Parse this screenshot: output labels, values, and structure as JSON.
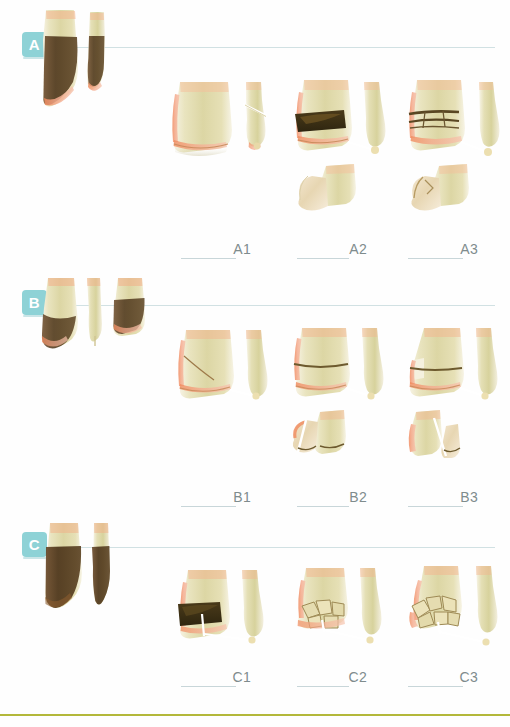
{
  "figure": {
    "title": "",
    "background_color": "#ffffff",
    "badge_color": "#8ed2d6",
    "rule_color": "#cfdfe2",
    "label_color": "#7f8c8d",
    "footer_rule_color": "#b3b83a"
  },
  "groups": [
    {
      "id": "group-a",
      "badge": "A",
      "overview_icon": "distal-tibia-fibula-extraarticular",
      "subtypes": [
        {
          "id": "a1",
          "label": "A1",
          "icon": "simple-extraarticular-fracture"
        },
        {
          "id": "a2",
          "label": "A2",
          "icon": "metaphyseal-wedge-fracture"
        },
        {
          "id": "a3",
          "label": "A3",
          "icon": "metaphyseal-complex-fracture"
        }
      ]
    },
    {
      "id": "group-b",
      "badge": "B",
      "overview_icon": "distal-tibia-fibula-partial-articular",
      "subtypes": [
        {
          "id": "b1",
          "label": "B1",
          "icon": "partial-articular-split-fracture"
        },
        {
          "id": "b2",
          "label": "B2",
          "icon": "partial-articular-split-depression"
        },
        {
          "id": "b3",
          "label": "B3",
          "icon": "partial-articular-multifragmentary-depression"
        }
      ]
    },
    {
      "id": "group-c",
      "badge": "C",
      "overview_icon": "distal-tibia-fibula-complete-articular",
      "subtypes": [
        {
          "id": "c1",
          "label": "C1",
          "icon": "complete-articular-simple-fracture"
        },
        {
          "id": "c2",
          "label": "C2",
          "icon": "complete-articular-simple-metaphyseal-multifragmentary"
        },
        {
          "id": "c3",
          "label": "C3",
          "icon": "complete-articular-multifragmentary"
        }
      ]
    }
  ]
}
